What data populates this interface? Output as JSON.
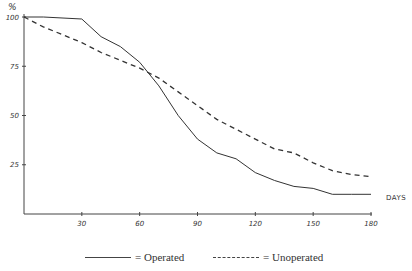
{
  "chart_data": {
    "type": "line",
    "title": "",
    "xlabel": "DAYS",
    "ylabel": "%",
    "xlim": [
      0,
      180
    ],
    "ylim": [
      0,
      100
    ],
    "x_ticks": [
      30,
      60,
      90,
      120,
      150,
      180
    ],
    "y_ticks": [
      25,
      50,
      75,
      100
    ],
    "grid": false,
    "legend_position": "bottom",
    "series": [
      {
        "name": "Operated",
        "style": "solid",
        "x": [
          0,
          10,
          30,
          40,
          50,
          60,
          70,
          80,
          90,
          100,
          110,
          120,
          130,
          140,
          150,
          160,
          170,
          180
        ],
        "values": [
          100,
          100,
          99,
          90,
          85,
          77,
          65,
          50,
          38,
          31,
          28,
          21,
          17,
          14,
          13,
          10,
          10,
          10
        ]
      },
      {
        "name": "Unoperated",
        "style": "dashed",
        "x": [
          0,
          10,
          20,
          30,
          40,
          50,
          60,
          70,
          80,
          90,
          100,
          110,
          120,
          130,
          140,
          150,
          160,
          170,
          180
        ],
        "values": [
          100,
          95,
          91,
          87,
          82,
          78,
          74,
          69,
          62,
          55,
          48,
          43,
          38,
          33,
          31,
          26,
          22,
          20,
          19
        ]
      }
    ]
  },
  "axis": {
    "y_unit": "%",
    "x_title": "DAYS",
    "y_tick_labels": [
      "100",
      "75",
      "50",
      "25"
    ],
    "x_tick_labels": [
      "30",
      "60",
      "90",
      "120",
      "150",
      "180"
    ]
  },
  "legend": {
    "operated_label": "= Operated",
    "unoperated_label": "= Unoperated"
  }
}
